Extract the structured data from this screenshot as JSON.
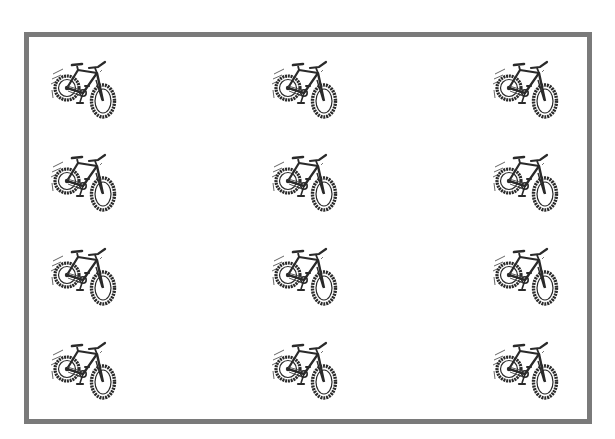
{
  "frame": {
    "border_color": "#7a7a7a"
  },
  "grid": {
    "rows": 4,
    "columns": 3,
    "icon": "bicycle-icon",
    "icon_color": "#2a2a2a",
    "positions": [
      {
        "row": 1,
        "col": 1,
        "x": 50,
        "y": 60
      },
      {
        "row": 1,
        "col": 2,
        "x": 271,
        "y": 60
      },
      {
        "row": 1,
        "col": 3,
        "x": 492,
        "y": 60
      },
      {
        "row": 2,
        "col": 1,
        "x": 50,
        "y": 153
      },
      {
        "row": 2,
        "col": 2,
        "x": 271,
        "y": 153
      },
      {
        "row": 2,
        "col": 3,
        "x": 492,
        "y": 153
      },
      {
        "row": 3,
        "col": 1,
        "x": 50,
        "y": 247
      },
      {
        "row": 3,
        "col": 2,
        "x": 271,
        "y": 247
      },
      {
        "row": 3,
        "col": 3,
        "x": 492,
        "y": 247
      },
      {
        "row": 4,
        "col": 1,
        "x": 50,
        "y": 341
      },
      {
        "row": 4,
        "col": 2,
        "x": 271,
        "y": 341
      },
      {
        "row": 4,
        "col": 3,
        "x": 492,
        "y": 341
      }
    ]
  }
}
